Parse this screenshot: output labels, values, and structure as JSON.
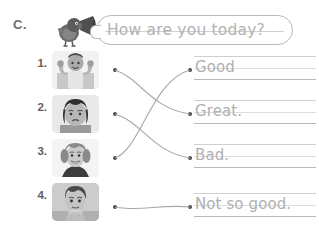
{
  "worksheet": {
    "section_label": "C.",
    "prompt": "How are you today?",
    "mascot_icon": "bird-with-megaphone-icon"
  },
  "items": [
    {
      "number": "1.",
      "photo_icon": "photo-child-flexing-muscles",
      "photo_alt": "Child flexing arm muscles"
    },
    {
      "number": "2.",
      "photo_icon": "photo-girl-sad",
      "photo_alt": "Girl looking sad"
    },
    {
      "number": "3.",
      "photo_icon": "photo-girl-smiling",
      "photo_alt": "Girl smiling"
    },
    {
      "number": "4.",
      "photo_icon": "photo-child-chin-on-hands",
      "photo_alt": "Child resting chin on hands"
    }
  ],
  "answers": [
    {
      "text": "Good"
    },
    {
      "text": "Great."
    },
    {
      "text": "Bad."
    },
    {
      "text": "Not so good."
    }
  ],
  "colors": {
    "ink": "#b0b0b0",
    "rule": "#cfcfcf",
    "dot": "#4a4a4a",
    "line": "#a8a8a8"
  }
}
